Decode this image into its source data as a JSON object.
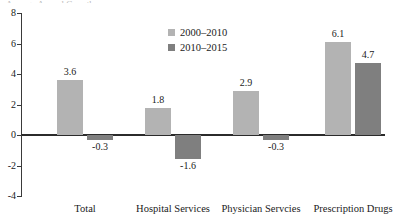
{
  "chart_data": {
    "type": "bar",
    "title": "",
    "title_remnant": "Average Annual Growth",
    "xlabel": "",
    "ylabel": "",
    "categories": [
      "Total",
      "Hospital Services",
      "Physician Servcies",
      "Prescription Drugs"
    ],
    "series": [
      {
        "name": "2000–2010",
        "color": "#b3b3b3",
        "values": [
          3.6,
          1.8,
          2.9,
          6.1
        ]
      },
      {
        "name": "2010–2015",
        "color": "#7f7f7f",
        "values": [
          -0.3,
          -1.6,
          -0.3,
          4.7
        ]
      }
    ],
    "data_labels": [
      [
        "3.6",
        "1.8",
        "2.9",
        "6.1"
      ],
      [
        "-0.3",
        "-1.6",
        "-0.3",
        "4.7"
      ]
    ],
    "ylim": [
      -4,
      8
    ],
    "ytick_values": [
      8,
      6,
      4,
      2,
      0,
      -2,
      -4
    ],
    "ytick_labels": [
      "8",
      "6",
      "4",
      "2",
      "0",
      "-2",
      "-4"
    ],
    "grid": false,
    "legend_position": "upper-center"
  }
}
